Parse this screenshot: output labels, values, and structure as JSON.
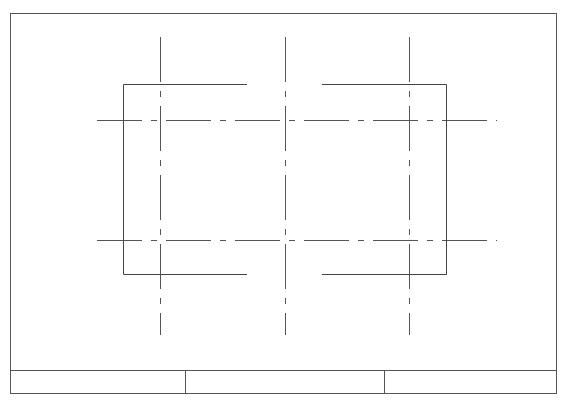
{
  "drawing": {
    "type": "cad-plan",
    "frame": {
      "x1": 10,
      "y1": 13,
      "x2": 556,
      "y2": 393,
      "stroke": "#555555"
    },
    "title_block": {
      "y_top": 370,
      "y_bottom": 393,
      "dividers_x": [
        185,
        384
      ],
      "cells": [
        {
          "label": ""
        },
        {
          "label": ""
        },
        {
          "label": ""
        }
      ]
    },
    "outline": {
      "left": 123,
      "right": 446,
      "top": 84,
      "bottom": 274,
      "gap_start_x": 247,
      "gap_end_x": 322,
      "stroke": "#444444"
    },
    "grid": {
      "vertical_x": [
        160,
        285,
        409
      ],
      "vertical_y_range": [
        37,
        335
      ],
      "horizontal_y": [
        120,
        240
      ],
      "horizontal_x_range": [
        97,
        497
      ],
      "line_style": "dash-dot",
      "stroke": "#555555"
    }
  }
}
